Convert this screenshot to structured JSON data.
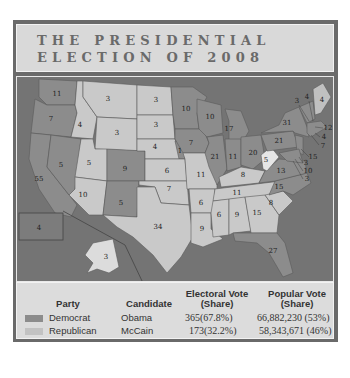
{
  "title": {
    "line1": "THE PRESIDENTIAL",
    "line2": "ELECTION OF 2008"
  },
  "colors": {
    "frame": "#6a6a6a",
    "water": "#747474",
    "democrat": "#8c8c8c",
    "republican": "#c9c9c9",
    "title_bg": "#d9d9d9",
    "legend_bg": "#dcdcdc"
  },
  "map": {
    "state_labels": [
      {
        "state": "WA",
        "ev": "11",
        "party": "democrat"
      },
      {
        "state": "OR",
        "ev": "7",
        "party": "democrat"
      },
      {
        "state": "CA",
        "ev": "55",
        "party": "democrat"
      },
      {
        "state": "NV",
        "ev": "5",
        "party": "democrat"
      },
      {
        "state": "ID",
        "ev": "4",
        "party": "republican"
      },
      {
        "state": "MT",
        "ev": "3",
        "party": "republican"
      },
      {
        "state": "WY",
        "ev": "3",
        "party": "republican"
      },
      {
        "state": "UT",
        "ev": "5",
        "party": "republican"
      },
      {
        "state": "AZ",
        "ev": "10",
        "party": "republican"
      },
      {
        "state": "CO",
        "ev": "9",
        "party": "democrat"
      },
      {
        "state": "NM",
        "ev": "5",
        "party": "democrat"
      },
      {
        "state": "ND",
        "ev": "3",
        "party": "republican"
      },
      {
        "state": "SD",
        "ev": "3",
        "party": "republican"
      },
      {
        "state": "NE",
        "ev": "4",
        "party": "republican"
      },
      {
        "state": "NE-2",
        "ev": "1",
        "party": "democrat"
      },
      {
        "state": "KS",
        "ev": "6",
        "party": "republican"
      },
      {
        "state": "OK",
        "ev": "7",
        "party": "republican"
      },
      {
        "state": "TX",
        "ev": "34",
        "party": "republican"
      },
      {
        "state": "MN",
        "ev": "10",
        "party": "democrat"
      },
      {
        "state": "IA",
        "ev": "7",
        "party": "democrat"
      },
      {
        "state": "MO",
        "ev": "11",
        "party": "republican"
      },
      {
        "state": "AR",
        "ev": "6",
        "party": "republican"
      },
      {
        "state": "LA",
        "ev": "9",
        "party": "republican"
      },
      {
        "state": "WI",
        "ev": "10",
        "party": "democrat"
      },
      {
        "state": "IL",
        "ev": "21",
        "party": "democrat"
      },
      {
        "state": "MI",
        "ev": "17",
        "party": "democrat"
      },
      {
        "state": "IN",
        "ev": "11",
        "party": "democrat"
      },
      {
        "state": "OH",
        "ev": "20",
        "party": "democrat"
      },
      {
        "state": "KY",
        "ev": "8",
        "party": "republican"
      },
      {
        "state": "TN",
        "ev": "11",
        "party": "republican"
      },
      {
        "state": "MS",
        "ev": "6",
        "party": "republican"
      },
      {
        "state": "AL",
        "ev": "9",
        "party": "republican"
      },
      {
        "state": "GA",
        "ev": "15",
        "party": "republican"
      },
      {
        "state": "FL",
        "ev": "27",
        "party": "democrat"
      },
      {
        "state": "SC",
        "ev": "8",
        "party": "republican"
      },
      {
        "state": "NC",
        "ev": "15",
        "party": "democrat"
      },
      {
        "state": "VA",
        "ev": "13",
        "party": "democrat"
      },
      {
        "state": "WV",
        "ev": "5",
        "party": "republican"
      },
      {
        "state": "PA",
        "ev": "21",
        "party": "democrat"
      },
      {
        "state": "NY",
        "ev": "31",
        "party": "democrat"
      },
      {
        "state": "VT",
        "ev": "3",
        "party": "democrat"
      },
      {
        "state": "NH",
        "ev": "4",
        "party": "democrat"
      },
      {
        "state": "ME",
        "ev": "4",
        "party": "democrat"
      },
      {
        "state": "MA",
        "ev": "12",
        "party": "democrat"
      },
      {
        "state": "RI",
        "ev": "4",
        "party": "democrat"
      },
      {
        "state": "CT",
        "ev": "7",
        "party": "democrat"
      },
      {
        "state": "NJ",
        "ev": "15",
        "party": "democrat"
      },
      {
        "state": "DE",
        "ev": "3",
        "party": "democrat"
      },
      {
        "state": "MD",
        "ev": "10",
        "party": "democrat"
      },
      {
        "state": "DC",
        "ev": "3",
        "party": "democrat"
      },
      {
        "state": "HI",
        "ev": "4",
        "party": "democrat"
      },
      {
        "state": "AK",
        "ev": "3",
        "party": "republican"
      }
    ]
  },
  "legend": {
    "headers": {
      "party": "Party",
      "candidate": "Candidate",
      "electoral_line1": "Electoral Vote",
      "electoral_line2": "(Share)",
      "popular_line1": "Popular Vote",
      "popular_line2": "(Share)"
    },
    "rows": [
      {
        "party": "Democrat",
        "candidate": "Obama",
        "electoral": "365(67.8%)",
        "popular": "66,882,230 (53%)"
      },
      {
        "party": "Republican",
        "candidate": "McCain",
        "electoral": "173(32.2%)",
        "popular": "58,343,671 (46%)"
      }
    ]
  }
}
